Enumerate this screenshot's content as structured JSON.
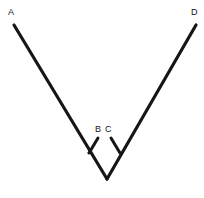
{
  "figure": {
    "background_color": "#ffffff",
    "stroke_color": "#161616",
    "canvas": {
      "width": 204,
      "height": 198
    },
    "labels": [
      {
        "id": "A",
        "text": "A",
        "x": 8,
        "y": 8,
        "point_x": 14,
        "point_y": 25
      },
      {
        "id": "D",
        "text": "D",
        "x": 191,
        "y": 8,
        "point_x": 196,
        "point_y": 25
      },
      {
        "id": "B",
        "text": "B",
        "x": 95,
        "y": 125,
        "point_x": 98,
        "point_y": 138
      },
      {
        "id": "C",
        "text": "C",
        "x": 105,
        "y": 125,
        "point_x": 111,
        "point_y": 138
      }
    ],
    "vertex": {
      "x": 107,
      "y": 179
    },
    "segments": [
      {
        "id": "segment-AV",
        "name": "left-arm",
        "x1": 14,
        "y1": 25,
        "x2": 107,
        "y2": 179,
        "width": 3.2
      },
      {
        "id": "segment-DV",
        "name": "right-arm",
        "x1": 196,
        "y1": 25,
        "x2": 107,
        "y2": 179,
        "width": 3.2
      },
      {
        "id": "segment-B",
        "name": "ray-b",
        "x1": 98,
        "y1": 138,
        "x2": 89,
        "y2": 153,
        "width": 3.0
      },
      {
        "id": "segment-C",
        "name": "ray-c",
        "x1": 111,
        "y1": 138,
        "x2": 120,
        "y2": 153,
        "width": 3.0
      }
    ]
  }
}
